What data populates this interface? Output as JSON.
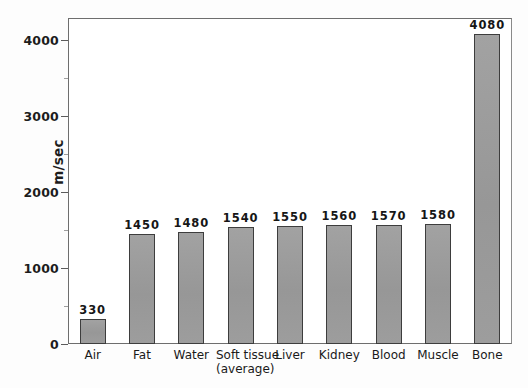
{
  "chart_data": {
    "type": "bar",
    "title": "",
    "subtitle": "",
    "xlabel": "",
    "ylabel": "m/sec",
    "ylim": [
      0,
      4290
    ],
    "grid": false,
    "legend": null,
    "categories": [
      "Air",
      "Fat",
      "Water",
      "Soft tissue\n(average)",
      "Liver",
      "Kidney",
      "Blood",
      "Muscle",
      "Bone"
    ],
    "category_lines": [
      [
        "Air"
      ],
      [
        "Fat"
      ],
      [
        "Water"
      ],
      [
        "Soft tissue",
        "(average)"
      ],
      [
        "Liver"
      ],
      [
        "Kidney"
      ],
      [
        "Blood"
      ],
      [
        "Muscle"
      ],
      [
        "Bone"
      ]
    ],
    "values": [
      330,
      1450,
      1480,
      1540,
      1550,
      1560,
      1570,
      1580,
      4080
    ],
    "value_labels": [
      "330",
      "1450",
      "1480",
      "1540",
      "1550",
      "1560",
      "1570",
      "1580",
      "4080"
    ],
    "y_ticks": [
      0,
      1000,
      2000,
      3000,
      4000
    ],
    "y_tick_labels": [
      "0",
      "1000",
      "2000",
      "3000",
      "4000"
    ],
    "y_minor_ticks": [
      500,
      1500,
      2500,
      3500
    ],
    "bar_color": "#9b9b9b",
    "bar_edge_color": "#3d3d3d",
    "axis_color": "#6e6e6e",
    "text_color": "#1a1a1a",
    "background": "#ffffff"
  }
}
